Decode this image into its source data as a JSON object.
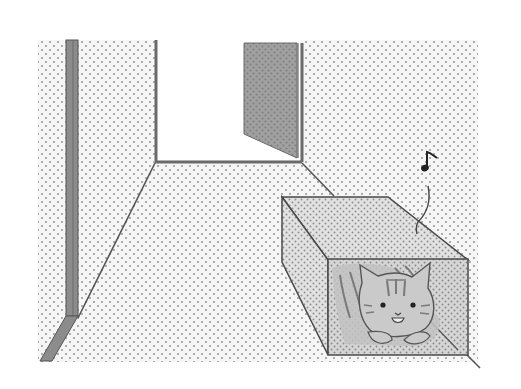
{
  "scene": {
    "title": "Cat hiding in a box tunnel in a hallway",
    "style": "manga screentone illustration",
    "elements": {
      "hallway_wall": "dotted screentone wall",
      "left_pillar": "gray wall edge / pillar",
      "back_doorway": "open white doorway",
      "door_panel": "gray open door panel",
      "floor": "dotted floor in perspective",
      "box_tunnel": "translucent box tunnel",
      "cat": "tabby cat peeking out of the box",
      "music_note": "♪"
    }
  },
  "colors": {
    "background": "#ffffff",
    "screentone_dot": "#9a9a9a",
    "wall_light": "#f4f4f4",
    "pillar_gray": "#8a8a8a",
    "door_gray": "#9c9c9c",
    "box_face": "#dedede",
    "box_front": "#d2d2d2",
    "outline": "#4a4a4a",
    "cat_fill": "#c8c8c8",
    "cat_stripes": "#7a7a7a"
  }
}
